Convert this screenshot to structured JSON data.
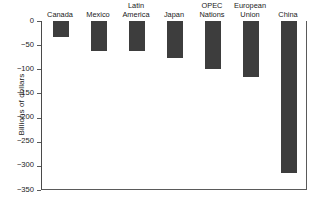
{
  "chart_data": {
    "type": "bar",
    "title": "",
    "xlabel": "",
    "ylabel": "Billions of dollars",
    "categories": [
      "Canada",
      "Mexico",
      "Latin America",
      "Japan",
      "OPEC Nations",
      "European Union",
      "China"
    ],
    "values": [
      -33,
      -62,
      -63,
      -77,
      -100,
      -116,
      -315
    ],
    "ylim": [
      -350,
      0
    ],
    "yticks": [
      0,
      -50,
      -100,
      -150,
      -200,
      -250,
      -300,
      -350
    ],
    "ytick_labels": [
      "0",
      "−50",
      "−100",
      "−150",
      "−200",
      "−250",
      "−300",
      "−350"
    ],
    "grid": false,
    "legend": null,
    "bar_color": "#3d3d3d",
    "axis_color": "#5a5a5a",
    "background": "#ffffff",
    "category_label_position": "above-axis"
  }
}
